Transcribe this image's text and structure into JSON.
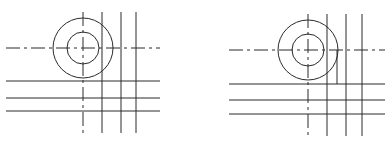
{
  "figures": [
    {
      "name": "left-drawing",
      "circle_center": [
        83,
        48
      ],
      "outer_radius": 30,
      "inner_radius": 16,
      "center_line_h": {
        "y": 48,
        "x1": 6,
        "x2": 160
      },
      "center_line_v": {
        "x": 83,
        "y1": 12,
        "y2": 133
      },
      "vertical_lines": [
        102,
        121,
        136
      ],
      "vertical_range": [
        12,
        133
      ],
      "horizontal_lines": [
        81,
        98,
        111
      ],
      "horizontal_range": [
        6,
        160
      ]
    },
    {
      "name": "right-drawing",
      "circle_center": [
        308,
        50
      ],
      "outer_radius": 30,
      "inner_radius": 16,
      "center_line_h": {
        "y": 50,
        "x1": 229,
        "x2": 385
      },
      "center_line_v": {
        "x": 308,
        "y1": 14,
        "y2": 136
      },
      "vertical_lines": [
        327,
        346,
        362
      ],
      "vertical_range": [
        14,
        136
      ],
      "short_vertical_line": {
        "x": 337,
        "y1": 50,
        "y2": 84
      },
      "horizontal_lines": [
        84,
        100,
        114
      ],
      "horizontal_range": [
        229,
        385
      ]
    }
  ],
  "colors": {
    "line": "#2a2a2a",
    "background": "#ffffff"
  }
}
